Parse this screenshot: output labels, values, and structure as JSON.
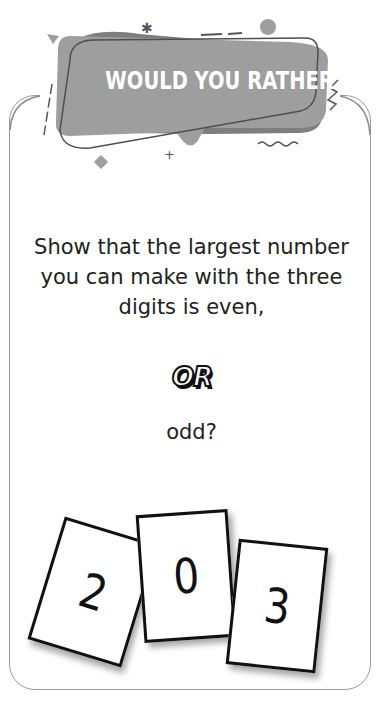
{
  "banner": {
    "title": "WOULD YOU RATHER"
  },
  "question": {
    "option_a": "Show that the largest number you can make with the three digits is even,",
    "divider": "OR",
    "option_b": "odd?"
  },
  "digit_cards": [
    {
      "digit": "2"
    },
    {
      "digit": "0"
    },
    {
      "digit": "3"
    }
  ],
  "colors": {
    "banner_fill": "#9b9b9b",
    "banner_shadow": "#7a7a7a",
    "outline": "#555555",
    "frame_border": "#9a9a9a",
    "text": "#222222"
  }
}
